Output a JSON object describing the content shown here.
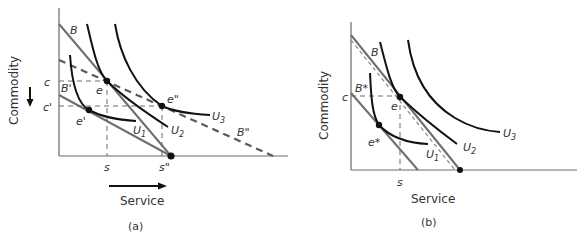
{
  "panels": [
    {
      "id": "a",
      "caption": "(a)",
      "xlabel": "Service",
      "ylabel": "Commodity",
      "x_direction_arrow": "right",
      "y_direction_arrow": "down",
      "lines": {
        "B": "B",
        "B_prime": "B'",
        "B_dprime": "B\""
      },
      "points": {
        "e": "e",
        "e_prime": "e'",
        "e_dprime": "e\""
      },
      "curves": {
        "U1": "U",
        "U1_sub": "1",
        "U2": "U",
        "U2_sub": "2",
        "U3": "U",
        "U3_sub": "3"
      },
      "ticks": {
        "c": "c",
        "c_prime": "c'",
        "s": "s",
        "s_dprime": "s\""
      }
    },
    {
      "id": "b",
      "caption": "(b)",
      "xlabel": "Service",
      "ylabel": "Commodity",
      "lines": {
        "B": "B",
        "B_star": "B*"
      },
      "points": {
        "e": "e",
        "e_star": "e*"
      },
      "curves": {
        "U1": "U",
        "U1_sub": "1",
        "U2": "U",
        "U2_sub": "2",
        "U3": "U",
        "U3_sub": "3"
      },
      "ticks": {
        "c": "c",
        "s": "s"
      }
    }
  ]
}
